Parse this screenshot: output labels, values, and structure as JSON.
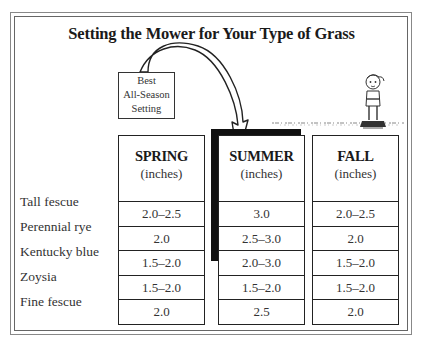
{
  "title": "Setting the Mower for Your Type of Grass",
  "callout": {
    "lines": [
      "Best",
      "All-Season",
      "Setting"
    ],
    "points_to": "SUMMER"
  },
  "columns": [
    {
      "season": "SPRING",
      "unit": "(inches)",
      "values": [
        "2.0–2.5",
        "2.0",
        "1.5–2.0",
        "1.5–2.0",
        "2.0"
      ]
    },
    {
      "season": "SUMMER",
      "unit": "(inches)",
      "values": [
        "3.0",
        "2.5–3.0",
        "2.0–3.0",
        "1.5–2.0",
        "2.5"
      ],
      "highlighted": true
    },
    {
      "season": "FALL",
      "unit": "(inches)",
      "values": [
        "2.0–2.5",
        "2.0",
        "1.5–2.0",
        "1.5–2.0",
        "2.0"
      ]
    }
  ],
  "rows": [
    "Tall fescue",
    "Perennial rye",
    "Kentucky blue",
    "Zoysia",
    "Fine fescue"
  ],
  "illustration": "cartoon-child-standing-on-lawn-icon",
  "colors": {
    "ink": "#222222",
    "highlight_shadow": "#111111",
    "frame": "#777777"
  }
}
